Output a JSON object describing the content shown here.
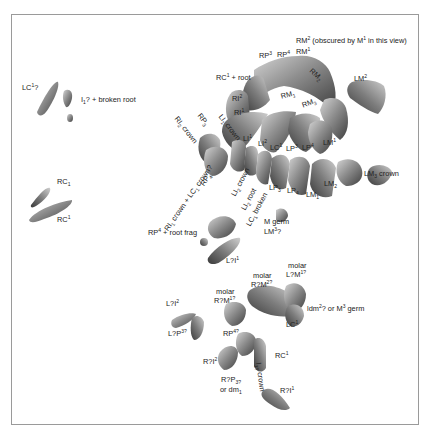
{
  "figure": {
    "type": "3D-reconstruction specimen plate (fossil dentition)",
    "frame_color": "#9a9a9a",
    "tooth_fill": "#8c8c8c",
    "tooth_shadow": "#4a4a4a",
    "tooth_highlight": "#cfcfcf"
  },
  "labels": [
    {
      "id": "lc1q",
      "base": "LC",
      "sup": "1",
      "tail": "?"
    },
    {
      "id": "i1broken",
      "base": "I",
      "sub": "1",
      "tail": "? + broken root"
    },
    {
      "id": "rc1_lower",
      "base": "RC",
      "sub": "1",
      "tail": ""
    },
    {
      "id": "rc1_upper",
      "base": "RC",
      "sup": "1",
      "tail": ""
    },
    {
      "id": "rm2_obscured",
      "base": "RM",
      "sup": "2",
      "tail": " (obscured by M",
      "sup2": "1",
      "tail2": " in this view)"
    },
    {
      "id": "rp3",
      "base": "RP",
      "sup": "3",
      "tail": ""
    },
    {
      "id": "rp4",
      "base": "RP",
      "sup": "4",
      "tail": ""
    },
    {
      "id": "rm1_upper",
      "base": "RM",
      "sup": "1",
      "tail": ""
    },
    {
      "id": "rm2_lower",
      "base": "RM",
      "sub": "2",
      "tail": ""
    },
    {
      "id": "lm2_upper",
      "base": "LM",
      "sup": "2",
      "tail": ""
    },
    {
      "id": "rc1root",
      "base": "RC",
      "sup": "1",
      "tail": " + root"
    },
    {
      "id": "ri2",
      "base": "RI",
      "sup": "2",
      "tail": ""
    },
    {
      "id": "ri1",
      "base": "RI",
      "sup": "1",
      "tail": ""
    },
    {
      "id": "rm1_lower",
      "base": "RM",
      "sub": "1",
      "tail": ""
    },
    {
      "id": "rm3_lower",
      "base": "RM",
      "sub": "3",
      "tail": ""
    },
    {
      "id": "li1",
      "base": "LI",
      "sup": "1",
      "tail": ""
    },
    {
      "id": "li2",
      "base": "LI",
      "sup": "2",
      "tail": ""
    },
    {
      "id": "lc1",
      "base": "LC",
      "sup": "1",
      "tail": ""
    },
    {
      "id": "lp3",
      "base": "LP",
      "sup": "3",
      "tail": ""
    },
    {
      "id": "lp4",
      "base": "LP",
      "sup": "4",
      "tail": ""
    },
    {
      "id": "lm1_upper",
      "base": "LM",
      "sup": "1",
      "tail": ""
    },
    {
      "id": "lm3crown",
      "base": "LM",
      "sub": "3",
      "tail": " crown"
    },
    {
      "id": "lm2_lower",
      "base": "LM",
      "sub": "2",
      "tail": ""
    },
    {
      "id": "lm1_lower",
      "base": "LM",
      "sub": "1",
      "tail": ""
    },
    {
      "id": "lp4_lower",
      "base": "LP",
      "sub": "4",
      "tail": ""
    },
    {
      "id": "lp3_lower",
      "base": "LP",
      "sub": "3",
      "tail": ""
    },
    {
      "id": "ri2crown",
      "base": "RI",
      "sub": "2",
      "tail": " crown"
    },
    {
      "id": "rp3_lower",
      "base": "RP",
      "sub": "3",
      "tail": ""
    },
    {
      "id": "li1crown",
      "base": "LI",
      "sub": "1",
      "tail": " crown"
    },
    {
      "id": "rp4_lower",
      "base": "RP",
      "sub": "4",
      "tail": ""
    },
    {
      "id": "ri1crown_lc1",
      "base": "RI",
      "sub": "1",
      "tail": " crown + LC",
      "sub2": "1",
      "tail2": " crown?"
    },
    {
      "id": "li2crown",
      "base": "LI",
      "sub": "2",
      "tail": " crown"
    },
    {
      "id": "li2root",
      "base": "LI",
      "sub": "2",
      "tail": " root"
    },
    {
      "id": "lc1broken",
      "base": "LC",
      "sub": "1",
      "tail": " broken"
    },
    {
      "id": "mgerm",
      "base": "M germ",
      "tail": ""
    },
    {
      "id": "lm3q",
      "base": "LM",
      "sup": "3",
      "tail": "?"
    },
    {
      "id": "rp4rootfrag",
      "base": "RP",
      "sup": "4",
      "tail": " + root frag"
    },
    {
      "id": "lqi1",
      "base": "L?I",
      "sup": "1",
      "tail": ""
    },
    {
      "id": "molar1_a",
      "base": "molar",
      "tail": ""
    },
    {
      "id": "molar1_b",
      "base": "L?M",
      "sup": "1?",
      "tail": ""
    },
    {
      "id": "molar2_a",
      "base": "molar",
      "tail": ""
    },
    {
      "id": "molar2_b",
      "base": "R?M",
      "sup": "2?",
      "tail": ""
    },
    {
      "id": "molar3_a",
      "base": "molar",
      "tail": ""
    },
    {
      "id": "molar3_b",
      "base": "R?M",
      "sup": "1?",
      "tail": ""
    },
    {
      "id": "lqi2",
      "base": "L?I",
      "sup": "2",
      "tail": ""
    },
    {
      "id": "idm2",
      "base": "ldm",
      "sup": "2",
      "tail": "? or M",
      "sup2": "3",
      "tail2": " germ"
    },
    {
      "id": "lqp3",
      "base": "L?P",
      "sup": "3?",
      "tail": ""
    },
    {
      "id": "lc1_b",
      "base": "LC",
      "sup": "1",
      "tail": ""
    },
    {
      "id": "rp3q",
      "base": "RP",
      "sup": "4?",
      "tail": ""
    },
    {
      "id": "rqi2",
      "base": "R?I",
      "sup": "2",
      "tail": ""
    },
    {
      "id": "rc1_b",
      "base": "RC",
      "sup": "1",
      "tail": ""
    },
    {
      "id": "i1crown",
      "base": "I",
      "sub": "1?",
      "tail": " crown"
    },
    {
      "id": "rqp3_a",
      "base": "R?P",
      "sub": "3?",
      "tail": ""
    },
    {
      "id": "rqp3_b",
      "base": "or dm",
      "sub": "1",
      "tail": ""
    },
    {
      "id": "rqi1",
      "base": "R?I",
      "sup": "1",
      "tail": ""
    }
  ]
}
